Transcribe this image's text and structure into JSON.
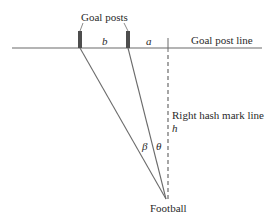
{
  "diagram": {
    "labels": {
      "goal_posts": "Goal posts",
      "goal_post_line": "Goal post line",
      "right_hash_mark_line": "Right hash mark line",
      "football": "Football",
      "b": "b",
      "a": "a",
      "h": "h",
      "beta": "β",
      "theta": "θ"
    },
    "colors": {
      "line": "#6b6b6b",
      "post": "#4d4d4d",
      "text": "#2a2a2a",
      "background": "#ffffff"
    }
  }
}
